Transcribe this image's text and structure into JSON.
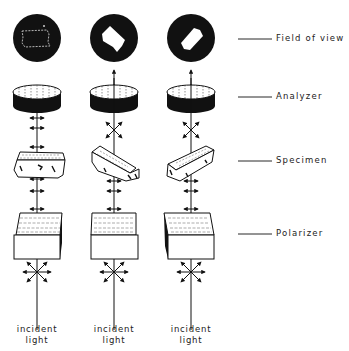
{
  "figure": {
    "columns": [
      {
        "id": "col1",
        "center_x": 37,
        "specimen_orientation": "aligned",
        "field_of_view": "dark with faint outline",
        "above_specimen_vibration": "horizontal"
      },
      {
        "id": "col2",
        "center_x": 114,
        "specimen_orientation": "rotated 45deg",
        "field_of_view": "bright specimen",
        "above_specimen_vibration": "diagonal cross"
      },
      {
        "id": "col3",
        "center_x": 191,
        "specimen_orientation": "rotated -45deg",
        "field_of_view": "bright specimen",
        "above_specimen_vibration": "diagonal cross"
      }
    ],
    "labels": {
      "field_of_view": "Field of view",
      "analyzer": "Analyzer",
      "specimen": "Specimen",
      "polarizer": "Polarizer"
    },
    "incident": {
      "line1": "incident",
      "line2": "light"
    },
    "colors": {
      "ink": "#111111",
      "paper": "#ffffff"
    }
  }
}
